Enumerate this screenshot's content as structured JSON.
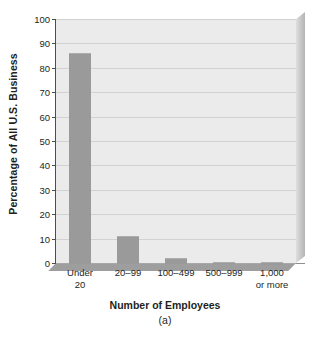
{
  "chart_data": {
    "type": "bar",
    "title": "",
    "xlabel": "Number of Employees",
    "ylabel": "Percentage of All U.S. Business",
    "caption": "(a)",
    "categories": [
      "Under 20",
      "20–99",
      "100–499",
      "500–999",
      "1,000 or more"
    ],
    "category_lines": [
      [
        "Under",
        "20"
      ],
      [
        "20–99"
      ],
      [
        "100–499"
      ],
      [
        "500–999"
      ],
      [
        "1,000",
        "or more"
      ]
    ],
    "values": [
      86,
      11,
      2,
      0.6,
      0.4
    ],
    "ylim": [
      0,
      100
    ],
    "ytick_labels": [
      "0",
      "10",
      "20",
      "30",
      "40",
      "50",
      "60",
      "70",
      "80",
      "90",
      "100"
    ],
    "ytick_values": [
      0,
      10,
      20,
      30,
      40,
      50,
      60,
      70,
      80,
      90,
      100
    ],
    "grid": true,
    "legend": false,
    "colors": {
      "bar": "#9a9a9a",
      "plot_background": "#ebebeb",
      "gridline": "#d2d2d2",
      "axis": "#4d4d4d",
      "text": "#231f20",
      "page_background": "#ffffff",
      "shelf": "#9e9e9e"
    }
  }
}
